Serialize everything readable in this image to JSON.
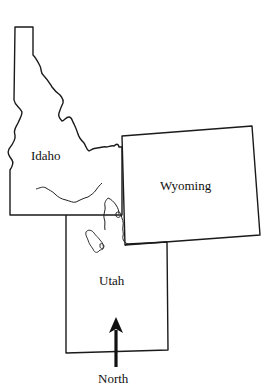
{
  "map": {
    "states": [
      {
        "id": "idaho",
        "label": "Idaho"
      },
      {
        "id": "wyoming",
        "label": "Wyoming"
      },
      {
        "id": "utah",
        "label": "Utah"
      }
    ],
    "compass": {
      "label": "North",
      "icon": "north-arrow-icon"
    },
    "features": [
      "snake-river",
      "great-salt-lake",
      "bear-lake",
      "idaho-montana-border"
    ]
  }
}
